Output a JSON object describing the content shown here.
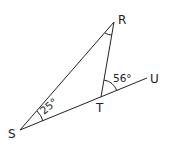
{
  "diagram": {
    "type": "geometry-triangle",
    "points": {
      "R": {
        "label": "R",
        "x": 114,
        "y": 22
      },
      "S": {
        "label": "S",
        "x": 20,
        "y": 130
      },
      "T": {
        "label": "T",
        "x": 101,
        "y": 97
      },
      "U": {
        "label": "U",
        "x": 147,
        "y": 78
      }
    },
    "segments": [
      {
        "from": "S",
        "to": "R"
      },
      {
        "from": "R",
        "to": "T"
      },
      {
        "from": "S",
        "to": "U",
        "note": "line S-T extended to U"
      }
    ],
    "angles": [
      {
        "vertex": "S",
        "label": "25°",
        "value": 25
      },
      {
        "vertex": "T",
        "label": "56°",
        "value": 56,
        "between": "R-T-U"
      },
      {
        "vertex": "R",
        "label": "",
        "note": "unlabeled angle mark"
      }
    ],
    "colors": {
      "stroke": "#222222",
      "background": "#ffffff"
    }
  }
}
